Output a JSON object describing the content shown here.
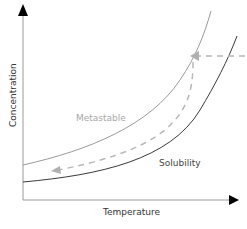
{
  "diagram": {
    "title": "",
    "x_axis_label": "Temperature",
    "y_axis_label": "Concentration",
    "curves": [
      {
        "name": "Metastable",
        "label": "Metastable",
        "color": "#9a9a9a",
        "style": "solid"
      },
      {
        "name": "Solubility",
        "label": "Solubility",
        "color": "#3a3a3a",
        "style": "solid"
      }
    ],
    "path": {
      "description": "cooling crystallization path",
      "color": "#b8b8b8",
      "style": "dashed"
    },
    "colors": {
      "axis": "#000000",
      "axis_line": "#9a9a9a",
      "metastable_text": "#a8a8a8",
      "solubility_text": "#444444",
      "axis_text": "#333333"
    }
  }
}
